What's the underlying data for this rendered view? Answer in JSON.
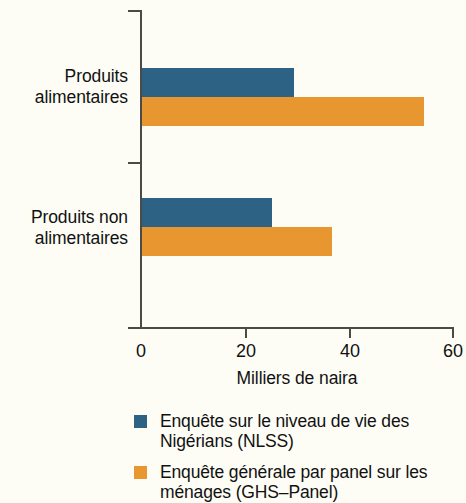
{
  "chart_data": {
    "type": "bar",
    "orientation": "horizontal",
    "title": "",
    "xlabel": "Milliers de naira",
    "ylabel": "",
    "xlim": [
      0,
      60
    ],
    "xticks": [
      0,
      20,
      40,
      60
    ],
    "xtick_labels": [
      "0",
      "20",
      "40",
      "60"
    ],
    "grid": false,
    "legend_position": "bottom-left",
    "categories": [
      "Produits alimentaires",
      "Produits non alimentaires"
    ],
    "category_lines": [
      [
        "Produits",
        "alimentaires"
      ],
      [
        "Produits non",
        "alimentaires"
      ]
    ],
    "series": [
      {
        "name": "Enquête sur le niveau de vie des Nigérians (NLSS)",
        "name_lines": [
          "Enquête sur le niveau de vie des",
          "Nigérians (NLSS)"
        ],
        "short_name": "NLSS",
        "color": "#2d6285",
        "values": [
          29.3,
          25.0
        ]
      },
      {
        "name": "Enquête générale par panel sur les ménages (GHS–Panel)",
        "name_lines": [
          "Enquête générale par panel sur les",
          "ménages (GHS–Panel)"
        ],
        "short_name": "GHS–Panel",
        "color": "#e8962f",
        "values": [
          54.5,
          36.7
        ]
      }
    ]
  },
  "colors": {
    "series_blue": "#2d6285",
    "series_orange": "#e8962f",
    "axis": "#4a4a46",
    "background": "#fdfdf6",
    "text": "#111111"
  }
}
